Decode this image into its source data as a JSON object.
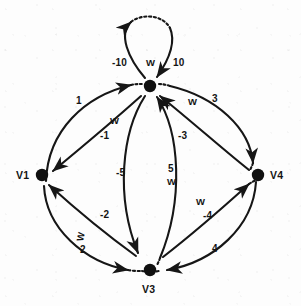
{
  "figure": {
    "type": "directed-weighted-graph",
    "background_color": "#fdfdfd",
    "ink_color": "#141414"
  },
  "vertices": [
    {
      "id": "v1",
      "label": "V1",
      "x": 42,
      "y": 175
    },
    {
      "id": "center",
      "label": "",
      "x": 150,
      "y": 86
    },
    {
      "id": "v3",
      "label": "V3",
      "x": 150,
      "y": 270
    },
    {
      "id": "v4",
      "label": "V4",
      "x": 258,
      "y": 175
    }
  ],
  "edges": [
    {
      "id": "self-loop-left",
      "from": "center",
      "to": "center",
      "weight": "-10",
      "marker": "W"
    },
    {
      "id": "self-loop-right",
      "from": "center",
      "to": "center",
      "weight": "10",
      "marker": ""
    },
    {
      "id": "v1-to-center",
      "from": "v1",
      "to": "center",
      "weight": "1",
      "marker": ""
    },
    {
      "id": "center-to-v1",
      "from": "center",
      "to": "v1",
      "weight": "-1",
      "marker": "W"
    },
    {
      "id": "center-to-v4",
      "from": "center",
      "to": "v4",
      "weight": "3",
      "marker": "W"
    },
    {
      "id": "v4-to-center",
      "from": "v4",
      "to": "center",
      "weight": "-3",
      "marker": ""
    },
    {
      "id": "center-to-v3-l",
      "from": "center",
      "to": "v3",
      "weight": "-5",
      "marker": ""
    },
    {
      "id": "v3-to-center-r",
      "from": "v3",
      "to": "center",
      "weight": "5",
      "marker": "W"
    },
    {
      "id": "v3-to-v1",
      "from": "v3",
      "to": "v1",
      "weight": "-2",
      "marker": ""
    },
    {
      "id": "v1-to-v3",
      "from": "v1",
      "to": "v3",
      "weight": "2",
      "marker": "W"
    },
    {
      "id": "v3-to-v4",
      "from": "v3",
      "to": "v4",
      "weight": "-4",
      "marker": "W"
    },
    {
      "id": "v4-to-v3",
      "from": "v4",
      "to": "v3",
      "weight": "4",
      "marker": ""
    }
  ],
  "labels": {
    "loop_neg10": "-10",
    "loop_w": "W",
    "loop_pos10": "10",
    "e1": "1",
    "e_w_upper_left": "W",
    "e_neg1": "-1",
    "e_w_upper_right": "W",
    "e3": "3",
    "e_neg3": "-3",
    "e_neg5": "-5",
    "e5": "5",
    "e_w_center": "W",
    "e_neg2": "-2",
    "e_w_lower_left": "W",
    "e2": "2",
    "e_w_lower_right": "W",
    "e_neg4": "-4",
    "e4": "4",
    "v1": "V1",
    "v3": "V3",
    "v4": "V4"
  }
}
